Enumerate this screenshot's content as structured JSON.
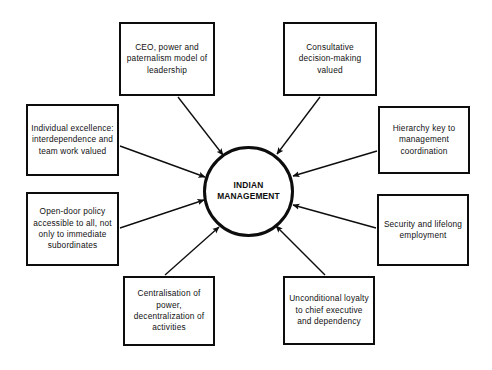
{
  "diagram": {
    "title": "INDIAN MANAGEMENT",
    "type": "hub-and-spoke",
    "hub": {
      "label": "INDIAN MANAGEMENT",
      "line1": "INDIAN",
      "line2": "MANAGEMENT",
      "center_x": 248.5,
      "center_y": 191,
      "radius": 45.5,
      "stroke_color": "#0d0d0d"
    },
    "colors": {
      "background": "#ffffff",
      "stroke": "#0d0d0d",
      "text": "#111111"
    },
    "nodes": [
      {
        "id": "ceo-power-paternalism",
        "text": "CEO, power and paternalism model of leadership",
        "position": "top-left",
        "x": 119,
        "y": 22,
        "width": 96,
        "height": 74
      },
      {
        "id": "consultative-decision-making",
        "text": "Consultative decision-making valued",
        "position": "top-right",
        "x": 283,
        "y": 22,
        "width": 94,
        "height": 74
      },
      {
        "id": "individual-excellence",
        "text": "Individual excellence: interdependence and team work valued",
        "position": "left-upper",
        "x": 26,
        "y": 104,
        "width": 93,
        "height": 72
      },
      {
        "id": "hierarchy-key",
        "text": "Hierarchy key to management coordination",
        "position": "right-upper",
        "x": 378,
        "y": 106,
        "width": 92,
        "height": 68
      },
      {
        "id": "open-door-policy",
        "text": "Open-door policy accessible to all, not only to immediate subordinates",
        "position": "left-lower",
        "x": 26,
        "y": 192,
        "width": 93,
        "height": 74
      },
      {
        "id": "security-lifelong-employment",
        "text": "Security and lifelong employment",
        "position": "right-lower",
        "x": 377,
        "y": 194,
        "width": 92,
        "height": 72
      },
      {
        "id": "centralisation-of-power",
        "text": "Centralisation of power, decentralization of activities",
        "position": "bottom-left",
        "x": 123,
        "y": 276,
        "width": 92,
        "height": 70
      },
      {
        "id": "unconditional-loyalty",
        "text": "Unconditional loyalty to chief executive and dependency",
        "position": "bottom-right",
        "x": 283,
        "y": 276,
        "width": 92,
        "height": 69
      }
    ],
    "arrows": [
      {
        "id": "arrow-ceo-power-paternalism",
        "from": "ceo-power-paternalism",
        "to": "hub",
        "x1": 178,
        "y1": 97,
        "x2": 223,
        "y2": 155
      },
      {
        "id": "arrow-consultative-decision-making",
        "from": "consultative-decision-making",
        "to": "hub",
        "x1": 320,
        "y1": 97,
        "x2": 277,
        "y2": 154
      },
      {
        "id": "arrow-individual-excellence",
        "from": "individual-excellence",
        "to": "hub",
        "x1": 120,
        "y1": 146,
        "x2": 205,
        "y2": 177
      },
      {
        "id": "arrow-hierarchy-key",
        "from": "hierarchy-key",
        "to": "hub",
        "x1": 377,
        "y1": 151,
        "x2": 293,
        "y2": 176
      },
      {
        "id": "arrow-open-door-policy",
        "from": "open-door-policy",
        "to": "hub",
        "x1": 120,
        "y1": 228,
        "x2": 204,
        "y2": 200
      },
      {
        "id": "arrow-security-lifelong-employment",
        "from": "security-lifelong-employment",
        "to": "hub",
        "x1": 376,
        "y1": 228,
        "x2": 293,
        "y2": 205
      },
      {
        "id": "arrow-centralisation-of-power",
        "from": "centralisation-of-power",
        "to": "hub",
        "x1": 165,
        "y1": 275,
        "x2": 219,
        "y2": 227
      },
      {
        "id": "arrow-unconditional-loyalty",
        "from": "unconditional-loyalty",
        "to": "hub",
        "x1": 325,
        "y1": 275,
        "x2": 276,
        "y2": 226
      }
    ]
  }
}
